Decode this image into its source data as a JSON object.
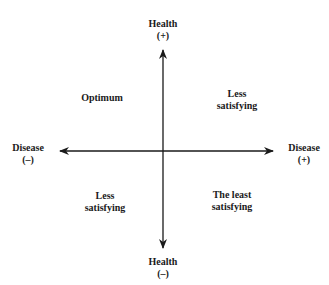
{
  "axes": {
    "top": {
      "title": "Health",
      "sign": "(+)"
    },
    "bottom": {
      "title": "Health",
      "sign": "(–)"
    },
    "left": {
      "title": "Disease",
      "sign": "(–)"
    },
    "right": {
      "title": "Disease",
      "sign": "(+)"
    }
  },
  "quadrants": {
    "top_left": {
      "line1": "Optimum",
      "line2": ""
    },
    "top_right": {
      "line1": "Less",
      "line2": "satisfying"
    },
    "bottom_left": {
      "line1": "Less",
      "line2": "satisfying"
    },
    "bottom_right": {
      "line1": "The least",
      "line2": "satisfying"
    }
  },
  "colors": {
    "ink": "#1a1a1a",
    "background": "#ffffff"
  }
}
